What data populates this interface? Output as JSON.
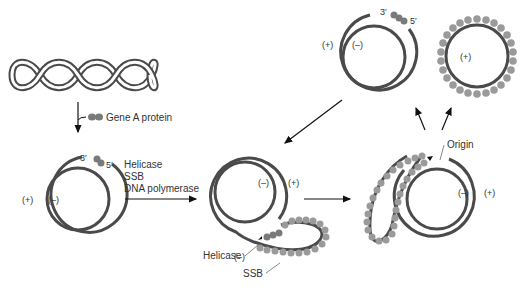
{
  "diagram": {
    "type": "rolling-circle replication",
    "colors": {
      "strand": "#4a4a4a",
      "protein": "#7a7a7a",
      "ssb": "#9a9a9a",
      "arrow": "#111111"
    },
    "stage1": {
      "protein_label": "Gene A protein"
    },
    "stage2": {
      "three_prime": "3′",
      "five_prime": "5′",
      "plus": "(+)",
      "minus": "(–)",
      "enzymes": [
        "Helicase",
        "SSB",
        "DNA polymerase"
      ]
    },
    "stage3": {
      "minus": "(–)",
      "plus": "(+)",
      "helicase_label": "Helicase",
      "ssb_label": "SSB"
    },
    "stage4": {
      "origin_label": "Origin",
      "minus": "(–)",
      "plus": "(+)"
    },
    "stage5a": {
      "three_prime": "3′",
      "five_prime": "5′",
      "plus": "(+)",
      "minus": "(–)"
    },
    "stage5b": {
      "plus": "(+)"
    }
  }
}
